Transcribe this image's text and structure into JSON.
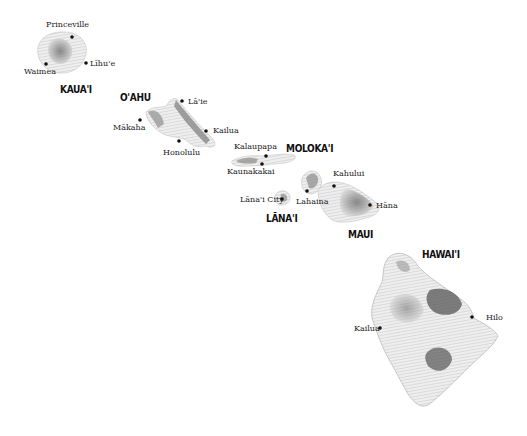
{
  "map": {
    "title": "Hawaiian Islands",
    "islands": [
      {
        "id": "kauai",
        "name": "KAUA'I",
        "towns": [
          {
            "name": "Princeville"
          },
          {
            "name": "Waimea"
          },
          {
            "name": "Līhu'e"
          }
        ]
      },
      {
        "id": "oahu",
        "name": "O'AHU",
        "towns": [
          {
            "name": "Lā'ie"
          },
          {
            "name": "Mākaha"
          },
          {
            "name": "Kailua"
          },
          {
            "name": "Honolulu"
          }
        ]
      },
      {
        "id": "molokai",
        "name": "MOLOKA'I",
        "towns": [
          {
            "name": "Kalaupapa"
          },
          {
            "name": "Kaunakakai"
          }
        ]
      },
      {
        "id": "lanai",
        "name": "LĀNA'I",
        "towns": [
          {
            "name": "Lāna'i City"
          }
        ]
      },
      {
        "id": "maui",
        "name": "MAUI",
        "towns": [
          {
            "name": "Kahului"
          },
          {
            "name": "Lahaina"
          },
          {
            "name": "Hāna"
          }
        ]
      },
      {
        "id": "hawaii",
        "name": "HAWAI'I",
        "towns": [
          {
            "name": "Kailua"
          },
          {
            "name": "Hilo"
          }
        ]
      }
    ]
  }
}
